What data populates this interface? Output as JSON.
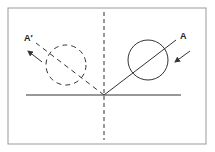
{
  "diagram": {
    "type": "reflection of a ball off a surface",
    "labels": {
      "incoming": "A",
      "reflected": "A′"
    },
    "colors": {
      "stroke": "#333333",
      "frame": "#999999",
      "background": "#ffffff"
    },
    "elements": [
      {
        "name": "surface-line",
        "kind": "solid line"
      },
      {
        "name": "normal-line",
        "kind": "dashed vertical line"
      },
      {
        "name": "incoming-ball",
        "kind": "solid circle"
      },
      {
        "name": "reflected-ball",
        "kind": "dashed circle"
      },
      {
        "name": "incident-path",
        "kind": "solid line"
      },
      {
        "name": "reflected-path",
        "kind": "dashed line"
      },
      {
        "name": "incoming-arrow",
        "kind": "arrow"
      },
      {
        "name": "outgoing-arrow",
        "kind": "arrow"
      }
    ]
  }
}
